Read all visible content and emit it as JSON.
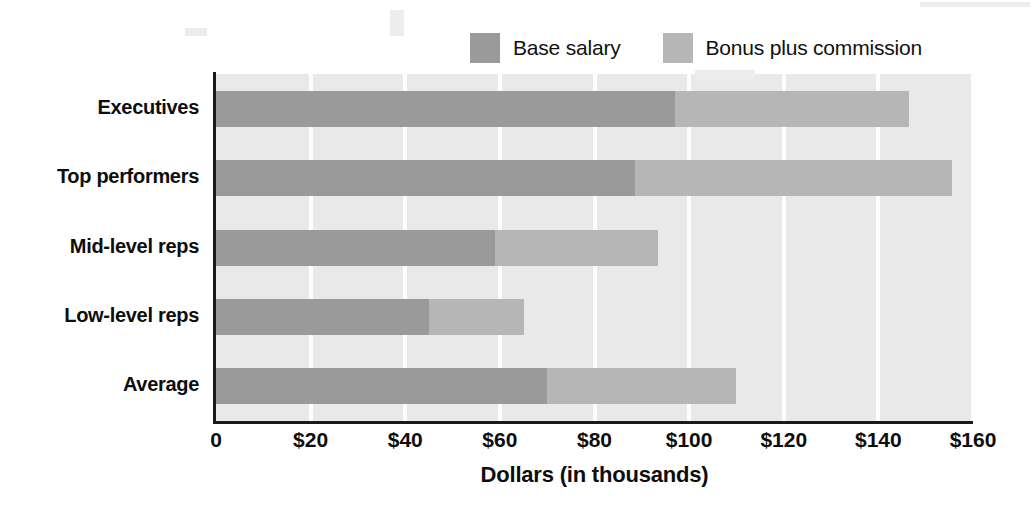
{
  "legend": {
    "entries": [
      {
        "label": "Base salary",
        "color": "#9a9a9a",
        "icon": "legend-swatch-icon"
      },
      {
        "label": "Bonus plus commission",
        "color": "#b6b6b6",
        "icon": "legend-swatch-icon"
      }
    ]
  },
  "axis": {
    "x_title": "Dollars (in thousands)",
    "tick_labels": [
      "0",
      "$20",
      "$40",
      "$60",
      "$80",
      "$100",
      "$120",
      "$140",
      "$160"
    ]
  },
  "categories_display": {
    "0": "Executives",
    "1": "Top performers",
    "2": "Mid-level reps",
    "3": "Low-level reps",
    "4": "Average"
  },
  "chart_data": {
    "type": "bar",
    "orientation": "horizontal",
    "stacked": true,
    "title": "",
    "subtitle": "",
    "xlabel": "Dollars (in thousands)",
    "ylabel": "",
    "xlim": [
      0,
      160
    ],
    "xticks": [
      0,
      20,
      40,
      60,
      80,
      100,
      120,
      140,
      160
    ],
    "xtick_labels": [
      "0",
      "$20",
      "$40",
      "$60",
      "$80",
      "$100",
      "$120",
      "$140",
      "$160"
    ],
    "grid": "vertical-white-gridlines",
    "legend_position": "top-right",
    "plot_background": "#e9e9e9",
    "categories": [
      "Executives",
      "Top performers",
      "Mid-level reps",
      "Low-level reps",
      "Average"
    ],
    "series": [
      {
        "name": "Base salary",
        "color": "#9a9a9a",
        "values": [
          97,
          88.5,
          59,
          45,
          70
        ]
      },
      {
        "name": "Bonus plus commission",
        "color": "#b6b6b6",
        "values": [
          49.5,
          67,
          34.5,
          20,
          40
        ]
      }
    ],
    "totals": [
      146.5,
      155.5,
      93.5,
      65,
      110
    ],
    "units": "thousands of dollars"
  }
}
